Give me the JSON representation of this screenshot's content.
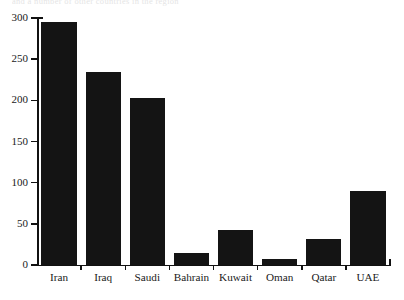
{
  "figure": {
    "clipped_text_above": "and a number of other countries in the region",
    "bar_color": "#141414",
    "axis_color": "#111111"
  },
  "chart_data": {
    "type": "bar",
    "title": "",
    "xlabel": "",
    "ylabel": "",
    "categories": [
      "Iran",
      "Iraq",
      "Saudi",
      "Bahrain",
      "Kuwait",
      "Oman",
      "Qatar",
      "UAE"
    ],
    "values": [
      295,
      235,
      203,
      14,
      43,
      7,
      32,
      90
    ],
    "ylim": [
      0,
      300
    ],
    "yticks": [
      0,
      50,
      100,
      150,
      200,
      250,
      300
    ],
    "ytick_labels": [
      "0",
      "50",
      "100",
      "150",
      "200",
      "250",
      "300"
    ],
    "grid": false,
    "legend": null,
    "legend_position": "none"
  }
}
